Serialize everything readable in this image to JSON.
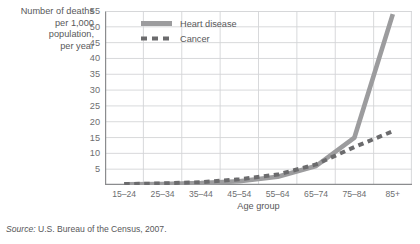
{
  "chart_data": {
    "type": "line",
    "title": "",
    "xlabel": "Age group",
    "ylabel": "Number of deaths per 1,000 population, per year",
    "ylabel_lines": [
      "Number of deaths",
      "per 1,000",
      "population,",
      "per year"
    ],
    "categories": [
      "15–24",
      "25–34",
      "35–44",
      "45–54",
      "55–64",
      "65–74",
      "75–84",
      "85+"
    ],
    "ylim": [
      0,
      55
    ],
    "yticks": [
      5,
      10,
      15,
      20,
      25,
      30,
      35,
      40,
      45,
      50,
      55
    ],
    "grid": true,
    "legend_position": "top-left-inside",
    "series": [
      {
        "name": "Heart disease",
        "style": "solid",
        "color": "#9c9c9e",
        "values": [
          0.2,
          0.3,
          0.6,
          1.2,
          2.6,
          6.0,
          15.0,
          54.0
        ]
      },
      {
        "name": "Cancer",
        "style": "dashed",
        "color": "#6b6b6d",
        "values": [
          0.3,
          0.5,
          0.9,
          1.8,
          3.3,
          6.5,
          12.0,
          17.0
        ]
      }
    ]
  },
  "source": {
    "prefix": "Source:",
    "text": " U.S. Bureau of the Census, 2007."
  },
  "colors": {
    "grid": "#d4d5d7",
    "axis": "#8b8c8e",
    "text": "#58585a",
    "heart_disease": "#9c9c9e",
    "cancer": "#6b6b6d"
  }
}
